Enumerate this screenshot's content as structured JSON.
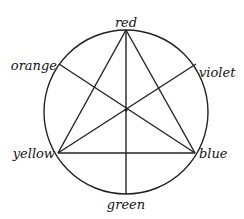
{
  "diagram": {
    "type": "color-wheel",
    "circle": {
      "cx": 126,
      "cy": 112,
      "r": 82
    },
    "stroke_color": "#222222",
    "nodes": [
      {
        "id": "red",
        "label": "red",
        "x": 126,
        "y": 30
      },
      {
        "id": "orange",
        "label": "orange",
        "x": 59,
        "y": 64
      },
      {
        "id": "violet",
        "label": "violet",
        "x": 196,
        "y": 64
      },
      {
        "id": "yellow",
        "label": "yellow",
        "x": 58,
        "y": 153
      },
      {
        "id": "blue",
        "label": "blue",
        "x": 195,
        "y": 153
      },
      {
        "id": "green",
        "label": "green",
        "x": 126,
        "y": 194
      }
    ],
    "edges": [
      {
        "from": "red",
        "to": "yellow"
      },
      {
        "from": "red",
        "to": "blue"
      },
      {
        "from": "yellow",
        "to": "blue"
      },
      {
        "from": "red",
        "to": "green"
      },
      {
        "from": "orange",
        "to": "blue"
      },
      {
        "from": "violet",
        "to": "yellow"
      }
    ],
    "labels": {
      "red": "red",
      "orange": "orange",
      "violet": "violet",
      "yellow": "yellow",
      "blue": "blue",
      "green": "green"
    }
  }
}
